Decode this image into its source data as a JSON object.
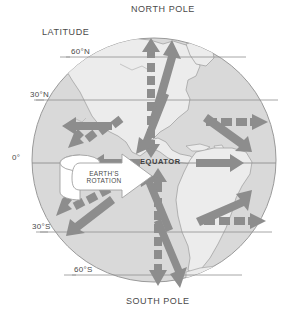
{
  "figure": {
    "kind": "earth-wind-circulation-diagram",
    "title_top": "NORTH POLE",
    "title_bottom": "SOUTH POLE",
    "latitude_caption": "LATITUDE",
    "equator_label": "EQUATOR",
    "rotation_label_line1": "EARTH'S",
    "rotation_label_line2": "ROTATION"
  },
  "latitude_labels": [
    {
      "id": "lat-60n",
      "text": "60°N"
    },
    {
      "id": "lat-30n",
      "text": "30°N"
    },
    {
      "id": "lat-0",
      "text": "0°"
    },
    {
      "id": "lat-30s",
      "text": "30°S"
    },
    {
      "id": "lat-60s",
      "text": "60°S"
    }
  ],
  "colors": {
    "background": "#ffffff",
    "ocean": "#d8d8d8",
    "land": "#ebebeb",
    "coastline": "#9a9a9a",
    "globe_outline": "#9a9a9a",
    "latitude_line": "#8f8f8f",
    "arrow": "#8d8d8d",
    "arrow_dashed": "#8d8d8d",
    "rotation_arrow_fill": "#ffffff",
    "rotation_arrow_stroke": "#a0a0a0",
    "text": "#4a4a4a"
  },
  "arrows": {
    "solid_legend": "solid gray block arrow",
    "dashed_legend": "dashed gray block arrow",
    "items": [
      {
        "name": "arrow-equator-west-solid",
        "style": "solid",
        "direction": "west"
      },
      {
        "name": "arrow-equator-east-solid",
        "style": "solid",
        "direction": "east"
      },
      {
        "name": "arrow-north-up-dashed",
        "style": "dashed",
        "direction": "north"
      },
      {
        "name": "arrow-north-up-solid",
        "style": "solid",
        "direction": "north-east"
      },
      {
        "name": "arrow-north-down-solid",
        "style": "solid",
        "direction": "south-west"
      },
      {
        "name": "arrow-south-down-dashed",
        "style": "dashed",
        "direction": "south"
      },
      {
        "name": "arrow-south-up-solid",
        "style": "solid",
        "direction": "north-west"
      },
      {
        "name": "arrow-south-down-solid",
        "style": "solid",
        "direction": "south-east"
      },
      {
        "name": "arrow-nw-west-solid",
        "style": "solid",
        "direction": "west"
      },
      {
        "name": "arrow-nw-southwest-dashed",
        "style": "dashed",
        "direction": "south-west"
      },
      {
        "name": "arrow-ne-east-dashed",
        "style": "dashed",
        "direction": "east"
      },
      {
        "name": "arrow-ne-southeast-solid",
        "style": "solid",
        "direction": "south-east"
      },
      {
        "name": "arrow-sw-southwest-solid",
        "style": "solid",
        "direction": "south-west"
      },
      {
        "name": "arrow-sw-west-dashed",
        "style": "dashed",
        "direction": "west"
      },
      {
        "name": "arrow-se-northeast-solid",
        "style": "solid",
        "direction": "north-east"
      },
      {
        "name": "arrow-se-east-dashed",
        "style": "dashed",
        "direction": "east"
      }
    ]
  }
}
